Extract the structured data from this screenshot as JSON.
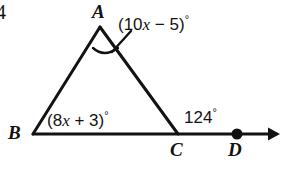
{
  "figure": {
    "type": "geometry-diagram",
    "background_color": "#ffffff",
    "stroke_color": "#121212",
    "corner_mark": "4",
    "vertices": {
      "A": {
        "label": "A",
        "x": 100,
        "y": 27
      },
      "B": {
        "label": "B",
        "x": 33,
        "y": 134
      },
      "C": {
        "label": "C",
        "x": 178,
        "y": 134
      },
      "D": {
        "label": "D",
        "x": 237,
        "y": 134
      }
    },
    "segments": [
      {
        "name": "side-AB",
        "from": "B",
        "to": "A"
      },
      {
        "name": "side-AC",
        "from": "A",
        "to": "C"
      },
      {
        "name": "base-ray-BD",
        "from": "B",
        "to": "arrow-end"
      }
    ],
    "ray": {
      "name": "ray-BD",
      "arrow_end_x": 277,
      "arrow_end_y": 134
    },
    "point_marker": {
      "name": "point-D-dot",
      "x": 237,
      "y": 134,
      "radius": 5
    },
    "angles": {
      "apex": {
        "name": "angle-A",
        "expression": "(10x − 5)",
        "prefix": "(10",
        "variable": "x",
        "suffix": " − 5)",
        "degree_symbol": "°",
        "has_arc": true,
        "has_leader_line": true
      },
      "base_left": {
        "name": "angle-B",
        "expression": "(8x + 3)",
        "prefix": "(8",
        "variable": "x",
        "suffix": " + 3)",
        "degree_symbol": "°",
        "has_arc": false
      },
      "exterior": {
        "name": "angle-ACD",
        "value": "124",
        "degree_symbol": "°",
        "has_arc": false
      }
    }
  }
}
